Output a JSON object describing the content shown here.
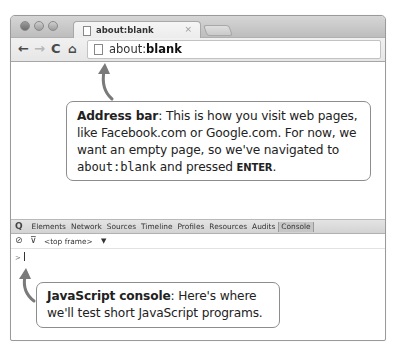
{
  "browser": {
    "tab": {
      "title": "about:blank",
      "close_glyph": "×"
    },
    "nav": {
      "back_glyph": "←",
      "forward_glyph": "→",
      "reload_glyph": "C",
      "home_glyph": "⌂"
    },
    "omnibox": {
      "prefix": "about:",
      "host": "blank"
    }
  },
  "devtools": {
    "search_glyph": "Q",
    "tabs": [
      {
        "label": "Elements"
      },
      {
        "label": "Network"
      },
      {
        "label": "Sources"
      },
      {
        "label": "Timeline"
      },
      {
        "label": "Profiles"
      },
      {
        "label": "Resources"
      },
      {
        "label": "Audits"
      },
      {
        "label": "Console",
        "active": true
      }
    ],
    "console_toolbar": {
      "clear_glyph": "⊘",
      "filter_glyph": "⊽",
      "frame_select": "<top frame>",
      "caret": "▼"
    },
    "prompt": ">"
  },
  "callouts": {
    "address": {
      "term": "Address bar",
      "text_1": ": This is how you visit web pages, like Facebook.com or Google.com. For now, we want an empty page, so we've navigated to ",
      "code": "about:blank",
      "text_2": " and pressed ",
      "key": "ENTER",
      "text_3": "."
    },
    "console": {
      "term": "JavaScript console",
      "text": ": Here's where we'll test short JavaScript programs."
    }
  },
  "colors": {
    "callout_border": "#8d8d8d",
    "arrow": "#7a7a7a",
    "window_border": "#9a9a9a"
  }
}
